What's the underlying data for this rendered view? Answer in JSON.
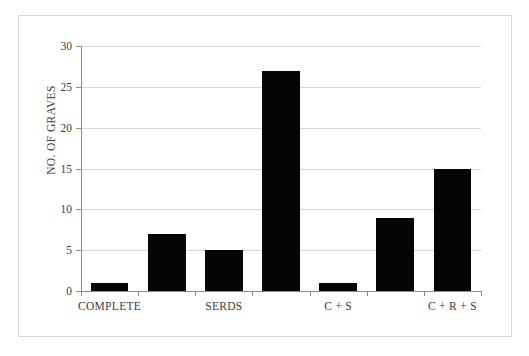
{
  "chart_data": {
    "type": "bar",
    "title": "",
    "xlabel": "",
    "ylabel": "NO. OF GRAVES",
    "ylim": [
      0,
      30
    ],
    "yticks": [
      0,
      5,
      10,
      15,
      20,
      25,
      30
    ],
    "ytick_labels": [
      "0",
      "5",
      "10",
      "15",
      "20",
      "25",
      "30"
    ],
    "grid": true,
    "legend": "none",
    "bar_color": "#050505",
    "gridline_color": "#d7d7d7",
    "axis_color": "#8c8c8c",
    "frame_color": "#d9d9d9",
    "background_color": "#ffffff",
    "categories": [
      "COMPLETE",
      "",
      "SERDS",
      "",
      "C + S",
      "",
      "C + R + S"
    ],
    "values": [
      1,
      7,
      5,
      27,
      1,
      9,
      15
    ],
    "visible_xtick_labels": [
      {
        "index": 0,
        "text": "COMPLETE"
      },
      {
        "index": 2,
        "text": "SERDS"
      },
      {
        "index": 4,
        "text": "C + S"
      },
      {
        "index": 6,
        "text": "C + R + S"
      }
    ]
  }
}
